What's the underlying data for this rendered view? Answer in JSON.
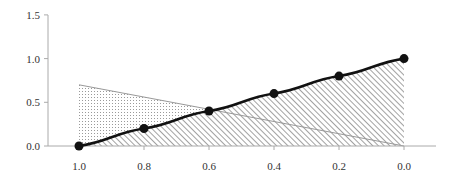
{
  "chart_data": {
    "type": "area",
    "title": "",
    "xlabel": "",
    "ylabel": "",
    "x_reversed": true,
    "xlim": [
      1.0,
      0.0
    ],
    "ylim": [
      0.0,
      1.5
    ],
    "grid": false,
    "legend": null,
    "x_ticks": [
      "1.0",
      "0.8",
      "0.6",
      "0.4",
      "0.2",
      "0.0"
    ],
    "y_ticks": [
      "0.0",
      "0.5",
      "1.0",
      "1.5"
    ],
    "series": [
      {
        "name": "smooth-curve",
        "style": "line-with-markers, smooth, area filled with diagonal hatch",
        "color": "#111111",
        "fill_pattern": "diagonal-hatch",
        "x": [
          1.0,
          0.8,
          0.6,
          0.4,
          0.2,
          0.0
        ],
        "y": [
          0.0,
          0.2,
          0.4,
          0.6,
          0.8,
          1.0
        ]
      },
      {
        "name": "triangle",
        "style": "thin line, area filled with dots",
        "color": "#999999",
        "fill_pattern": "dots",
        "x": [
          1.0,
          0.0
        ],
        "y": [
          0.7,
          0.0
        ]
      }
    ]
  }
}
